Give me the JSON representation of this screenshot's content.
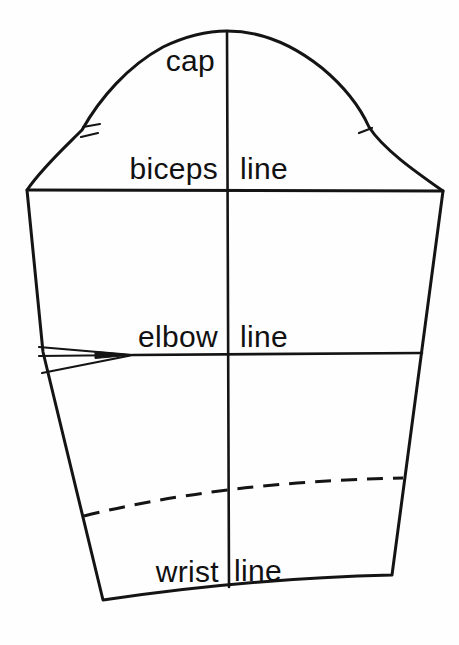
{
  "diagram": {
    "type": "sleeve-pattern-draft",
    "ink_color": "#141414",
    "background_color": "#fefefe",
    "labels": {
      "cap": "cap",
      "biceps": "biceps",
      "biceps_line": "line",
      "elbow": "elbow",
      "elbow_line": "line",
      "wrist": "wrist",
      "wrist_line": "line"
    }
  }
}
